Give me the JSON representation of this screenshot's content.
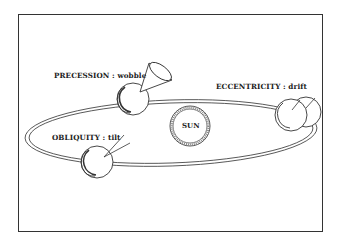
{
  "diagram": {
    "title": "",
    "center": {
      "label": "SUN"
    },
    "cycles": [
      {
        "id": "precession",
        "name": "PRECESSION",
        "separator": " : ",
        "description": "wobble",
        "label": "PRECESSION : wobble"
      },
      {
        "id": "eccentricity",
        "name": "ECCENTRICITY",
        "separator": " : ",
        "description": "drift",
        "label": "ECCENTRICITY : drift"
      },
      {
        "id": "obliquity",
        "name": "OBLIQUITY",
        "separator": " : ",
        "description": "tilt",
        "label": "OBLIQUITY : tilt"
      }
    ],
    "colors": {
      "stroke": "#333333",
      "background": "#ffffff",
      "text": "#222222"
    }
  }
}
